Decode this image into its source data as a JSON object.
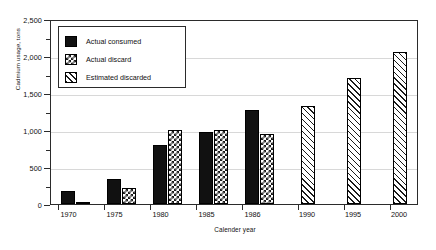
{
  "chart_data": {
    "type": "bar",
    "title": "",
    "xlabel": "Calender year",
    "ylabel": "Cadmium usage, tons",
    "categories": [
      "1970",
      "1975",
      "1980",
      "1985",
      "1986",
      "1990",
      "1995",
      "2000"
    ],
    "series": [
      {
        "name": "Actual consumed",
        "values": [
          175,
          340,
          800,
          975,
          1275,
          null,
          null,
          null
        ]
      },
      {
        "name": "Actual discard",
        "values": [
          28,
          215,
          1000,
          1000,
          950,
          null,
          null,
          null
        ]
      },
      {
        "name": "Estimated discarded",
        "values": [
          null,
          null,
          null,
          null,
          null,
          1325,
          1700,
          2050
        ]
      }
    ],
    "ylim": [
      0,
      2500
    ],
    "ytick_labels": [
      "0",
      "500",
      "1,000",
      "1,500",
      "2,000",
      "2,500"
    ],
    "ytick_values": [
      0,
      500,
      1000,
      1500,
      2000,
      2500
    ],
    "yminor_values": [
      250,
      750,
      1250,
      1750,
      2250
    ],
    "grid": true,
    "legend_position": "upper-left-inside"
  },
  "legend": {
    "items": [
      {
        "label": "Actual consumed",
        "pattern": "solid-black",
        "color": "#111111"
      },
      {
        "label": "Actual discard",
        "pattern": "checkerboard",
        "color": "#1a1a1a"
      },
      {
        "label": "Estimated discarded",
        "pattern": "diagonal-hatch",
        "color": "#1a1a1a"
      }
    ]
  },
  "axes": {
    "y_title": "Cadmium usage, tons",
    "x_title": "Calender year"
  }
}
